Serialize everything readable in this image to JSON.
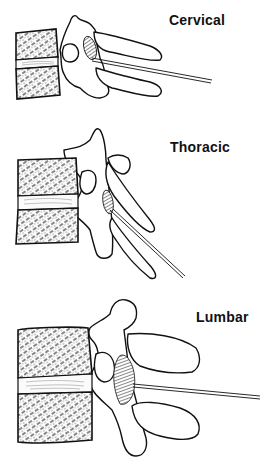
{
  "figure": {
    "panels": [
      {
        "id": "cervical",
        "label": "Cervical"
      },
      {
        "id": "thoracic",
        "label": "Thoracic"
      },
      {
        "id": "lumbar",
        "label": "Lumbar"
      }
    ]
  },
  "colors": {
    "background": "#ffffff",
    "ink": "#111111"
  }
}
